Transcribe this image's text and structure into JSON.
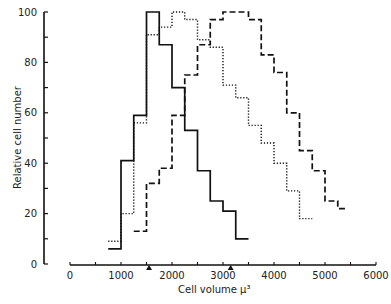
{
  "chart_data": {
    "type": "line",
    "subtype": "step-histogram",
    "title": "",
    "xlabel": "Cell volume µ³",
    "ylabel": "Relative cell number",
    "xlim": [
      0,
      6000
    ],
    "ylim": [
      0,
      100
    ],
    "x_ticks": [
      0,
      1000,
      2000,
      3000,
      4000,
      5000,
      6000
    ],
    "y_ticks": [
      0,
      20,
      40,
      60,
      80,
      100
    ],
    "grid": false,
    "legend": null,
    "bin_width": 250,
    "annotations": [
      {
        "type": "arrow-marker",
        "x": 1550,
        "description": "arrow under x-axis"
      },
      {
        "type": "arrow-marker",
        "x": 3150,
        "description": "arrow under x-axis"
      }
    ],
    "series": [
      {
        "name": "solid",
        "style": "solid",
        "bin_starts": [
          750,
          1000,
          1250,
          1500,
          1750,
          2000,
          2250,
          2500,
          2750,
          3000,
          3250
        ],
        "values": [
          6,
          41,
          59,
          100,
          87,
          70,
          53,
          37,
          25,
          21,
          10
        ],
        "end": 3500
      },
      {
        "name": "dotted",
        "style": "dotted",
        "bin_starts": [
          750,
          1000,
          1250,
          1500,
          1750,
          2000,
          2250,
          2500,
          2750,
          3000,
          3250,
          3500,
          3750,
          4000,
          4250,
          4500
        ],
        "values": [
          9,
          20,
          56,
          91,
          94,
          100,
          97,
          89,
          86,
          71,
          66,
          55,
          48,
          40,
          29,
          18
        ],
        "end": 4750
      },
      {
        "name": "dashed",
        "style": "dashed",
        "bin_starts": [
          1250,
          1500,
          1750,
          2000,
          2250,
          2500,
          2750,
          3000,
          3250,
          3500,
          3750,
          4000,
          4250,
          4500,
          4750,
          5000,
          5250
        ],
        "values": [
          13,
          32,
          38,
          59,
          75,
          87,
          97,
          100,
          100,
          97,
          83,
          76,
          60,
          45,
          37,
          25,
          22
        ],
        "end": 5450
      }
    ]
  },
  "labels": {
    "xlabel": "Cell volume µ³",
    "ylabel": "Relative cell number"
  }
}
